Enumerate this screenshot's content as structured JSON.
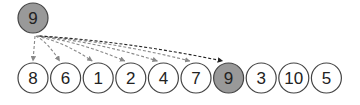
{
  "diagram": {
    "type": "array-search-illustration",
    "colors": {
      "highlight_fill": "#999999",
      "normal_fill": "#ffffff",
      "stroke": "#444444",
      "arrow_gray": "#888888",
      "arrow_dark": "#222222"
    },
    "key": {
      "label": "9",
      "highlighted": true
    },
    "array": [
      {
        "label": "8",
        "highlighted": false
      },
      {
        "label": "6",
        "highlighted": false
      },
      {
        "label": "1",
        "highlighted": false
      },
      {
        "label": "2",
        "highlighted": false
      },
      {
        "label": "4",
        "highlighted": false
      },
      {
        "label": "7",
        "highlighted": false
      },
      {
        "label": "9",
        "highlighted": true
      },
      {
        "label": "3",
        "highlighted": false
      },
      {
        "label": "10",
        "highlighted": false
      },
      {
        "label": "5",
        "highlighted": false
      }
    ],
    "arrows_to_indices": [
      0,
      1,
      2,
      3,
      4,
      5,
      6
    ],
    "match_index": 6
  }
}
